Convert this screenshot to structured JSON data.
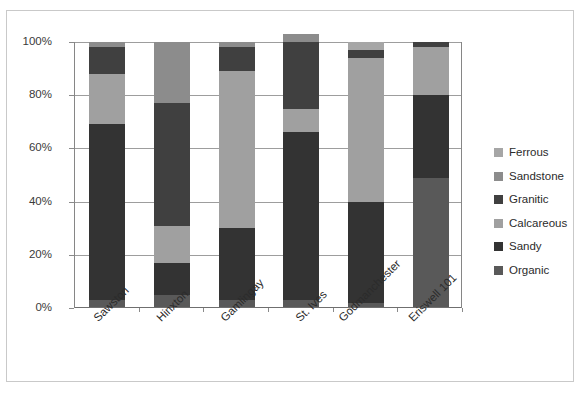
{
  "chart_data": {
    "type": "bar",
    "subtype": "stacked-100-percent",
    "title": "",
    "xlabel": "",
    "ylabel": "",
    "ylim": [
      0,
      100
    ],
    "ytick_labels": [
      "0%",
      "20%",
      "40%",
      "60%",
      "80%",
      "100%"
    ],
    "ytick_values": [
      0,
      20,
      40,
      60,
      80,
      100
    ],
    "grid": true,
    "legend_position": "right",
    "categories": [
      "Sawston",
      "Hinxton",
      "Gamlingay",
      "St. Ives",
      "Godmanchester",
      "Eriswell 101"
    ],
    "series": [
      {
        "name": "Organic",
        "color": "#595959",
        "values": [
          3,
          5,
          3,
          3,
          2,
          49
        ]
      },
      {
        "name": "Sandy",
        "color": "#333333",
        "values": [
          66,
          12,
          27,
          63,
          38,
          31
        ]
      },
      {
        "name": "Calcareous",
        "color": "#a0a0a0",
        "values": [
          19,
          14,
          59,
          9,
          54,
          18
        ]
      },
      {
        "name": "Granitic",
        "color": "#404040",
        "values": [
          10,
          46,
          9,
          25,
          3,
          2
        ]
      },
      {
        "name": "Sandstone",
        "color": "#8c8c8c",
        "values": [
          2,
          23,
          2,
          3,
          0,
          0
        ]
      },
      {
        "name": "Ferrous",
        "color": "#a6a6a6",
        "values": [
          0,
          0,
          0,
          0,
          3,
          0
        ]
      }
    ]
  },
  "legend": {
    "items": [
      {
        "label": "Ferrous",
        "color": "#a6a6a6"
      },
      {
        "label": "Sandstone",
        "color": "#8c8c8c"
      },
      {
        "label": "Granitic",
        "color": "#404040"
      },
      {
        "label": "Calcareous",
        "color": "#a0a0a0"
      },
      {
        "label": "Sandy",
        "color": "#333333"
      },
      {
        "label": "Organic",
        "color": "#595959"
      }
    ]
  },
  "axis": {
    "y_labels": [
      "100%",
      "80%",
      "60%",
      "40%",
      "20%",
      "0%"
    ],
    "x_labels": [
      "Sawston",
      "Hinxton",
      "Gamlingay",
      "St. Ives",
      "Godmanchester",
      "Eriswell 101"
    ]
  },
  "style": {
    "frame_border": "#c9c9c9",
    "gridline": "#9d9d9d",
    "axis_line": "#868686",
    "text": "#2b2b2b"
  }
}
